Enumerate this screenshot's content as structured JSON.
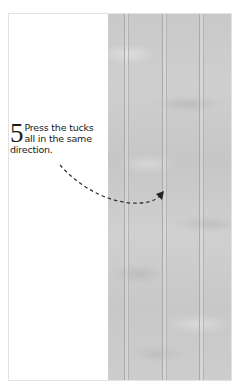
{
  "illustration": {
    "subject": "fabric-with-pressed-tucks",
    "tuck_count": 3,
    "colors": {
      "fabric": "#cbcbcb",
      "tuck_line": "#a9a9a9",
      "border": "#e2e2e2",
      "text": "#1a1a1a",
      "arrow": "#333333"
    }
  },
  "step": {
    "number": "5",
    "text": "Press the tucks all in the same direction."
  },
  "arrow": {
    "icon": "dashed-curved-arrow-icon"
  }
}
